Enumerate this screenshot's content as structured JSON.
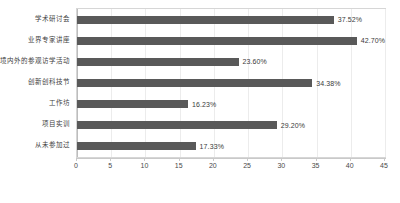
{
  "chart_data": {
    "type": "bar",
    "orientation": "horizontal",
    "title": "",
    "xlabel": "",
    "ylabel": "",
    "xlim": [
      0,
      45
    ],
    "xticks": [
      0,
      5,
      10,
      15,
      20,
      25,
      30,
      35,
      40,
      45
    ],
    "grid": true,
    "legend": false,
    "bar_color": "#595959",
    "categories": [
      "学术研讨会",
      "业界专家讲座",
      "境内外的参观访学活动",
      "创新创科技节",
      "工作坊",
      "项目实训",
      "从未参加过"
    ],
    "values": [
      37.52,
      42.7,
      23.6,
      34.38,
      16.23,
      29.2,
      17.33
    ],
    "value_labels": [
      "37.52%",
      "42.70%",
      "23.60%",
      "34.38%",
      "16.23%",
      "29.20%",
      "17.33%"
    ],
    "xtick_labels": [
      "0",
      "5",
      "10",
      "15",
      "20",
      "25",
      "30",
      "35",
      "40",
      "45"
    ]
  }
}
